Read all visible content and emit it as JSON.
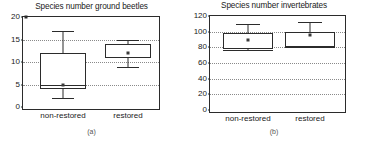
{
  "figure": {
    "width": 365,
    "height": 143,
    "background": "#ffffff",
    "axis_color": "#2b2b2b",
    "grid_color": "#8a8a8a",
    "marker_color": "#3a3a3a"
  },
  "panels": [
    {
      "id": "a",
      "subcaption": "(a)",
      "chart_data": {
        "type": "box",
        "title": "Species number ground beetles",
        "xlabel": "",
        "ylabel": "",
        "ylim": [
          0,
          20
        ],
        "yticks": [
          0,
          5,
          10,
          15,
          20
        ],
        "ytick_labels": [
          "0",
          "5",
          "10",
          "15",
          "20"
        ],
        "grid": true,
        "grid_axis": "y",
        "legend": "none",
        "categories": [
          "non-restored",
          "restored"
        ],
        "boxes": [
          {
            "category": "non-restored",
            "whisker_low": 2,
            "q1": 4,
            "median": 5,
            "q3": 12,
            "whisker_high": 17,
            "mean": 5
          },
          {
            "category": "restored",
            "whisker_low": 9,
            "q1": 11,
            "median": 11.2,
            "q3": 14,
            "whisker_high": 15,
            "mean": 12
          }
        ],
        "annotations": [
          {
            "name": "stray-speck",
            "x": "non-restored-left-edge",
            "y": 20
          }
        ]
      }
    },
    {
      "id": "b",
      "subcaption": "(b)",
      "chart_data": {
        "type": "box",
        "title": "Species number invertebrates",
        "xlabel": "",
        "ylabel": "",
        "ylim": [
          0,
          120
        ],
        "yticks": [
          0,
          20,
          40,
          60,
          80,
          100,
          120
        ],
        "ytick_labels": [
          "0",
          "20",
          "40",
          "60",
          "80",
          "100",
          "120"
        ],
        "grid": true,
        "grid_axis": "y",
        "legend": "none",
        "categories": [
          "non-restored",
          "restored"
        ],
        "boxes": [
          {
            "category": "non-restored",
            "whisker_low": 76,
            "q1": 78,
            "median": 77,
            "q3": 98,
            "whisker_high": 110,
            "mean": 90
          },
          {
            "category": "restored",
            "whisker_low": 80,
            "q1": 81,
            "median": 80.5,
            "q3": 100,
            "whisker_high": 112,
            "mean": 96
          }
        ],
        "annotations": []
      }
    }
  ]
}
